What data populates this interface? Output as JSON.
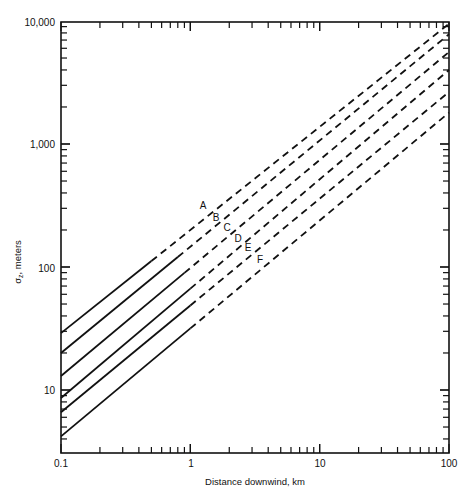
{
  "chart_data": {
    "type": "line",
    "title": "",
    "xlabel": "Distance downwind, km",
    "ylabel": "σz, meters",
    "xscale": "log",
    "yscale": "log",
    "xlim": [
      0.1,
      100
    ],
    "ylim": [
      3,
      10000
    ],
    "x_tick_labels": [
      "0.1",
      "1",
      "10",
      "100"
    ],
    "y_tick_labels": [
      "10",
      "100",
      "1,000",
      "10,000"
    ],
    "grid": false,
    "legend": "inline labels A–F",
    "series": [
      {
        "name": "A",
        "x": [
          0.1,
          0.5,
          100
        ],
        "values": [
          29,
          110,
          9500
        ],
        "solid_until": 0.5,
        "dashed_after": 0.5
      },
      {
        "name": "B",
        "x": [
          0.1,
          0.8,
          100
        ],
        "values": [
          20,
          120,
          7800
        ],
        "solid_until": 0.8,
        "dashed_after": 0.8
      },
      {
        "name": "C",
        "x": [
          0.1,
          0.9,
          100
        ],
        "values": [
          13,
          85,
          5600
        ],
        "solid_until": 0.9,
        "dashed_after": 0.9
      },
      {
        "name": "D",
        "x": [
          0.1,
          1,
          100
        ],
        "values": [
          8.6,
          60,
          4000
        ],
        "solid_until": 1,
        "dashed_after": 1
      },
      {
        "name": "E",
        "x": [
          0.1,
          1,
          100
        ],
        "values": [
          6.6,
          45,
          2650
        ],
        "solid_until": 1,
        "dashed_after": 1
      },
      {
        "name": "F",
        "x": [
          0.1,
          1,
          100
        ],
        "values": [
          4.2,
          30,
          1800
        ],
        "solid_until": 1,
        "dashed_after": 1
      }
    ],
    "annotations": [
      {
        "text": "A",
        "x": 1.2,
        "y": 300
      },
      {
        "text": "B",
        "x": 1.5,
        "y": 240
      },
      {
        "text": "C",
        "x": 1.8,
        "y": 200
      },
      {
        "text": "D",
        "x": 2.2,
        "y": 160
      },
      {
        "text": "E",
        "x": 2.6,
        "y": 135
      },
      {
        "text": "F",
        "x": 3.1,
        "y": 110
      }
    ]
  },
  "axes": {
    "x_title": "Distance downwind, km",
    "y_title_main": "σ",
    "y_title_sub": "z",
    "y_title_rest": ", meters",
    "x_ticks": [
      "0.1",
      "1",
      "10",
      "100"
    ],
    "y_ticks": [
      "10",
      "100",
      "1,000",
      "10,000"
    ]
  },
  "labels": [
    "A",
    "B",
    "C",
    "D",
    "E",
    "F"
  ]
}
